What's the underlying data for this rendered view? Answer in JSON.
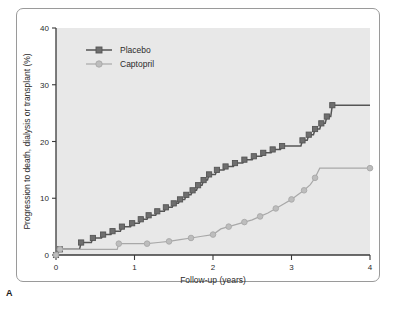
{
  "figure": {
    "panel_label": "A",
    "background_color": "#ffffff",
    "plot_background_color": "#e8e8e8",
    "frame_color": "#9a9a9a"
  },
  "chart_data": {
    "type": "line",
    "title": "",
    "subtitle": "",
    "xlabel": "Follow-up (years)",
    "ylabel": "Progression to death, dialysis or transplant (%)",
    "xlim": [
      0,
      4
    ],
    "ylim": [
      0,
      40
    ],
    "xticks": [
      0,
      1,
      2,
      3,
      4
    ],
    "xtick_labels": [
      "0",
      "1",
      "2",
      "3",
      "4"
    ],
    "yticks": [
      0,
      10,
      20,
      30,
      40
    ],
    "ytick_labels": [
      "0",
      "10",
      "20",
      "30",
      "40"
    ],
    "grid": false,
    "legend_position": "top-left",
    "legend": [
      "Placebo",
      "Captopril"
    ],
    "series": [
      {
        "name": "Placebo",
        "marker": "square",
        "color": "#555555",
        "marker_color": "#6e6e6e",
        "points": [
          [
            0.0,
            0.0
          ],
          [
            0.05,
            1.0
          ],
          [
            0.3,
            1.0
          ],
          [
            0.32,
            2.2
          ],
          [
            0.45,
            2.2
          ],
          [
            0.47,
            3.0
          ],
          [
            0.58,
            3.0
          ],
          [
            0.6,
            3.6
          ],
          [
            0.7,
            3.6
          ],
          [
            0.72,
            4.2
          ],
          [
            0.82,
            4.2
          ],
          [
            0.84,
            5.0
          ],
          [
            0.95,
            5.0
          ],
          [
            0.97,
            5.6
          ],
          [
            1.06,
            5.6
          ],
          [
            1.08,
            6.3
          ],
          [
            1.16,
            6.3
          ],
          [
            1.18,
            7.0
          ],
          [
            1.27,
            7.0
          ],
          [
            1.29,
            7.7
          ],
          [
            1.38,
            7.7
          ],
          [
            1.4,
            8.4
          ],
          [
            1.48,
            8.4
          ],
          [
            1.5,
            9.1
          ],
          [
            1.56,
            9.1
          ],
          [
            1.58,
            9.8
          ],
          [
            1.64,
            9.8
          ],
          [
            1.66,
            10.6
          ],
          [
            1.72,
            10.6
          ],
          [
            1.74,
            11.4
          ],
          [
            1.79,
            11.4
          ],
          [
            1.81,
            12.3
          ],
          [
            1.86,
            12.3
          ],
          [
            1.88,
            13.2
          ],
          [
            1.93,
            13.2
          ],
          [
            1.95,
            14.2
          ],
          [
            2.03,
            14.2
          ],
          [
            2.05,
            15.0
          ],
          [
            2.14,
            15.0
          ],
          [
            2.16,
            15.6
          ],
          [
            2.26,
            15.6
          ],
          [
            2.28,
            16.2
          ],
          [
            2.38,
            16.2
          ],
          [
            2.4,
            16.8
          ],
          [
            2.5,
            16.8
          ],
          [
            2.52,
            17.4
          ],
          [
            2.62,
            17.4
          ],
          [
            2.64,
            18.0
          ],
          [
            2.74,
            18.0
          ],
          [
            2.76,
            18.6
          ],
          [
            2.86,
            18.6
          ],
          [
            2.88,
            19.2
          ],
          [
            3.12,
            19.2
          ],
          [
            3.14,
            20.2
          ],
          [
            3.2,
            20.2
          ],
          [
            3.22,
            21.2
          ],
          [
            3.28,
            21.2
          ],
          [
            3.3,
            22.2
          ],
          [
            3.36,
            22.2
          ],
          [
            3.38,
            23.2
          ],
          [
            3.43,
            23.2
          ],
          [
            3.45,
            24.4
          ],
          [
            3.5,
            24.4
          ],
          [
            3.52,
            26.4
          ],
          [
            4.0,
            26.4
          ]
        ]
      },
      {
        "name": "Captopril",
        "marker": "circle",
        "color": "#a8a8a8",
        "marker_color": "#bdbdbd",
        "points": [
          [
            0.0,
            0.0
          ],
          [
            0.05,
            1.0
          ],
          [
            0.78,
            1.0
          ],
          [
            0.8,
            2.0
          ],
          [
            1.02,
            2.0
          ],
          [
            1.16,
            2.0
          ],
          [
            1.3,
            2.2
          ],
          [
            1.44,
            2.4
          ],
          [
            1.58,
            2.7
          ],
          [
            1.72,
            3.0
          ],
          [
            1.86,
            3.3
          ],
          [
            2.0,
            3.6
          ],
          [
            2.1,
            4.6
          ],
          [
            2.2,
            5.0
          ],
          [
            2.3,
            5.4
          ],
          [
            2.4,
            5.8
          ],
          [
            2.5,
            6.2
          ],
          [
            2.6,
            6.8
          ],
          [
            2.7,
            7.4
          ],
          [
            2.8,
            8.2
          ],
          [
            2.9,
            9.0
          ],
          [
            3.0,
            9.8
          ],
          [
            3.08,
            10.6
          ],
          [
            3.16,
            11.4
          ],
          [
            3.24,
            12.4
          ],
          [
            3.3,
            13.6
          ],
          [
            3.36,
            15.3
          ],
          [
            4.0,
            15.3
          ]
        ]
      }
    ]
  }
}
